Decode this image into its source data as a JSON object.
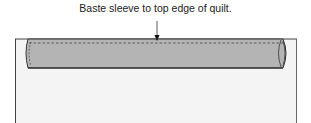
{
  "diagram": {
    "caption": "Baste sleeve to top edge of quilt.",
    "colors": {
      "quilt_fill": "#f4f4f4",
      "sleeve_fill": "#b4b4b4",
      "outline": "#333333"
    }
  }
}
